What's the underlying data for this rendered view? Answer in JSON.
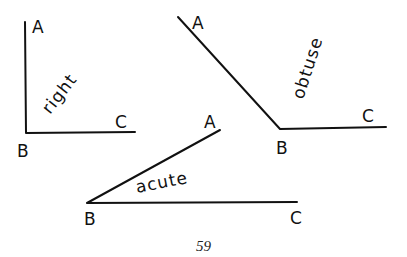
{
  "diagram": {
    "right": {
      "name": "right",
      "vertex": "B",
      "ray1_end": "A",
      "ray2_end": "C"
    },
    "obtuse": {
      "name": "obtuse",
      "vertex": "B",
      "ray1_end": "A",
      "ray2_end": "C"
    },
    "acute": {
      "name": "acute",
      "vertex": "B",
      "ray1_end": "A",
      "ray2_end": "C"
    }
  },
  "page_number": "59",
  "colors": {
    "ink": "#111111",
    "background": "#ffffff"
  }
}
